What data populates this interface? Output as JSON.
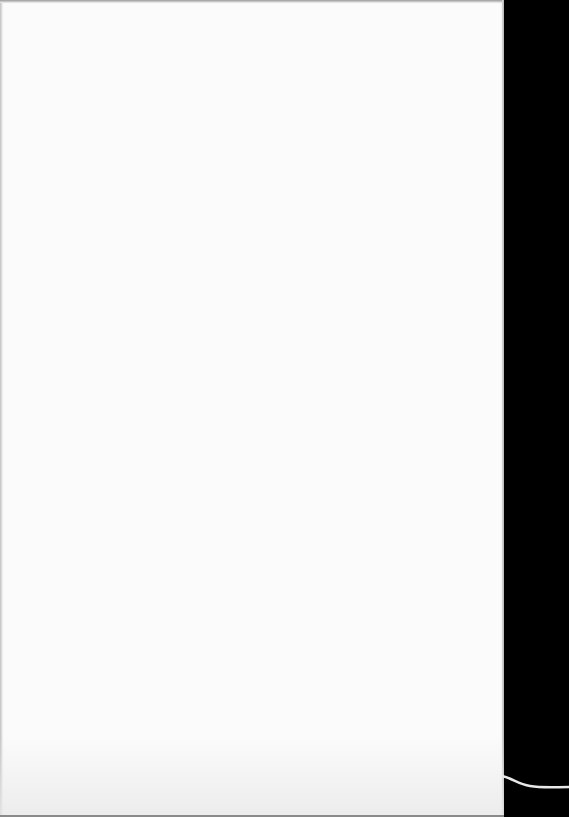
{
  "document": {
    "description": "Blank scanned page",
    "text_content": "",
    "colors": {
      "page": "#fbfbfb",
      "background": "#000000",
      "curl_line": "#e8e8e8"
    }
  }
}
